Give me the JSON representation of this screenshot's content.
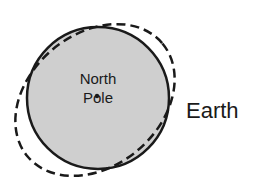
{
  "diagram": {
    "center_label_line1": "North",
    "center_label_line2": "Pole",
    "body_label": "Earth",
    "colors": {
      "fill": "#cfcfcf",
      "stroke": "#1a1a1a",
      "background": "#ffffff"
    }
  }
}
